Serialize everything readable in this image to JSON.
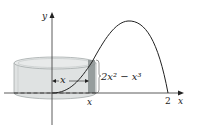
{
  "figure": {
    "y_axis_label": "y",
    "x_axis_label": "x",
    "x_tick_label": "x",
    "x_end_tick": "2",
    "radius_label": "x",
    "height_label": "2x² − x³",
    "curve": "y = 2x^2 - x^3",
    "colors": {
      "shell_fill": "#d9dcdc",
      "shell_edge": "#9aa0a0",
      "curve": "#222222",
      "strip": "#7d8484"
    }
  }
}
